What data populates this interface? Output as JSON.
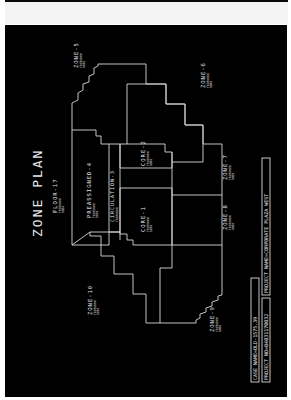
{
  "title": "ZONE PLAN",
  "floor": {
    "label": "FLOOR-17",
    "sub1": "TRIFUNNN",
    "sub2": "1000"
  },
  "zones": [
    {
      "id": "zone-5",
      "label": "ZONE-5",
      "sub1": "TRIFUNNN",
      "sub2": "1030"
    },
    {
      "id": "zone-6",
      "label": "ZONE-6",
      "sub1": "TRIFUNNN",
      "sub2": "1000"
    },
    {
      "id": "preassigned-4",
      "label": "PREASSIGNED-4",
      "sub1": "TRIFUNNN",
      "sub2": "1030"
    },
    {
      "id": "circulation-3",
      "label": "CIRCULATION-3",
      "sub1": "TRIFUNNN",
      "sub2": "1000"
    },
    {
      "id": "core-2",
      "label": "CORE-2",
      "sub1": "TRIFUNNN",
      "sub2": "1000"
    },
    {
      "id": "core-1",
      "label": "CORE-1",
      "sub1": "TRIFUNNN",
      "sub2": "1030"
    },
    {
      "id": "zone-7",
      "label": "ZONE-7",
      "sub1": "TRIFUNNN",
      "sub2": "1000"
    },
    {
      "id": "zone-8",
      "label": "ZONE-8",
      "sub1": "TRIFUNNN",
      "sub2": "1000"
    },
    {
      "id": "zone-9",
      "label": "ZONE-9",
      "sub1": "TRIFUNNN",
      "sub2": "1000"
    },
    {
      "id": "zone-10",
      "label": "ZONE-10",
      "sub1": "TRIFUNNN",
      "sub2": "1030"
    }
  ],
  "title_block": {
    "case_name": "CASE NAME=OLD-1575.39",
    "project_no": "PROJECT NO=04031170032",
    "project_name": "PROJECT NAME=CORPORATE PLAZA WEST"
  },
  "colors": {
    "background": "#000000",
    "lines": "#d8d8d8",
    "text": "#e8e8e8"
  }
}
